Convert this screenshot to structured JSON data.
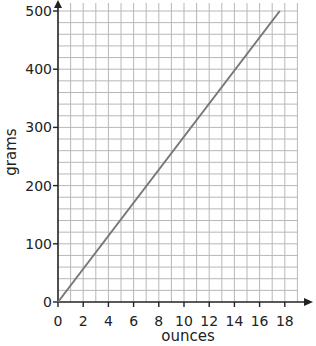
{
  "chart_data": {
    "type": "line",
    "title": "",
    "xlabel": "ounces",
    "ylabel": "grams",
    "xlim": [
      0,
      18
    ],
    "ylim": [
      0,
      500
    ],
    "xticks": [
      0,
      2,
      4,
      6,
      8,
      10,
      12,
      14,
      16,
      18
    ],
    "yticks": [
      0,
      100,
      200,
      300,
      400,
      500
    ],
    "grid": true,
    "grid_minor": {
      "x_step": 1,
      "y_step": 20
    },
    "legend": null,
    "series": [
      {
        "name": "ounces to grams",
        "x": [
          0,
          17.6
        ],
        "y": [
          0,
          500
        ]
      }
    ]
  },
  "colors": {
    "grid": "#b8b8b8",
    "axis": "#222222",
    "line": "#777777"
  }
}
